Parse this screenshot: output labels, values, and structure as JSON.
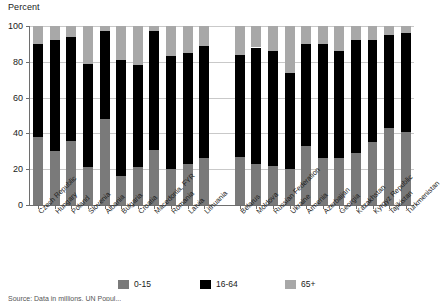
{
  "chart_data": {
    "type": "bar",
    "subtype": "stacked-100-percent",
    "title": "",
    "ylabel": "Percent",
    "xlabel": "",
    "ylim": [
      0,
      100
    ],
    "yticks": [
      0,
      20,
      40,
      60,
      80,
      100
    ],
    "grid": true,
    "legend_position": "bottom",
    "stacked_order_bottom_to_top": [
      "0-15",
      "16-64",
      "65+"
    ],
    "categories": [
      "Czech Republic",
      "Hungary",
      "Poland",
      "Slovenia",
      "Albania",
      "Bulgaria",
      "Croatia",
      "Macedonia, FYR",
      "Romania",
      "Latvia",
      "Lithuania",
      "Belarus",
      "Moldova",
      "Russian Federation",
      "Ukraine",
      "Armenia",
      "Azerbaijan",
      "Georgia",
      "Kazakhstan",
      "Kyrgyz Republic",
      "Tajikistan",
      "Turkmenistan"
    ],
    "group_break_after_index": 10,
    "series": [
      {
        "name": "0-15",
        "color": "#7a7a7a",
        "values": [
          38,
          30,
          36,
          21,
          48,
          16,
          21,
          31,
          20,
          23,
          26,
          27,
          23,
          22,
          20,
          33,
          26,
          26,
          29,
          35,
          43,
          41
        ]
      },
      {
        "name": "16-64",
        "color": "#000000",
        "values": [
          52,
          62,
          58,
          58,
          49,
          65,
          57,
          66,
          63,
          62,
          63,
          57,
          65,
          64,
          54,
          57,
          64,
          60,
          63,
          57,
          52,
          55
        ]
      },
      {
        "name": "65+",
        "color": "#a8a8a8",
        "values": [
          10,
          8,
          6,
          21,
          3,
          19,
          22,
          3,
          17,
          15,
          11,
          16,
          12,
          14,
          26,
          10,
          10,
          14,
          8,
          8,
          5,
          4
        ]
      }
    ]
  },
  "legend": {
    "items": [
      {
        "label": "0-15",
        "color": "#7a7a7a"
      },
      {
        "label": "16-64",
        "color": "#000000"
      },
      {
        "label": "65+",
        "color": "#a8a8a8"
      }
    ]
  },
  "axis": {
    "y_title": "Percent",
    "y_tick_labels": [
      "100",
      "80",
      "60",
      "40",
      "20",
      "0"
    ]
  },
  "source_note": "Source: Data in millions, UN Popul..."
}
